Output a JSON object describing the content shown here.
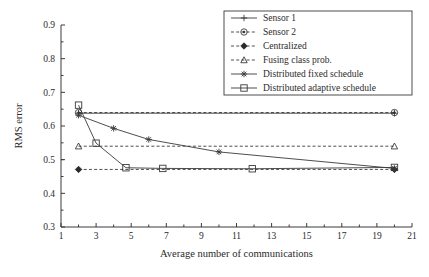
{
  "chart_data": {
    "type": "line",
    "title": "",
    "xlabel": "Average number of communications",
    "ylabel": "RMS error",
    "xlim": [
      1,
      21
    ],
    "ylim": [
      0.3,
      0.9
    ],
    "xticks": [
      1,
      3,
      5,
      7,
      9,
      11,
      13,
      15,
      17,
      19,
      21
    ],
    "yticks": [
      0.3,
      0.4,
      0.5,
      0.6,
      0.7,
      0.8,
      0.9
    ],
    "xticklabels": [
      "1",
      "3",
      "5",
      "7",
      "9",
      "11",
      "13",
      "15",
      "17",
      "19",
      "21"
    ],
    "yticklabels": [
      "0.3",
      "0.4",
      "0.5",
      "0.6",
      "0.7",
      "0.8",
      "0.9"
    ],
    "grid": false,
    "legend_position": "upper right",
    "series": [
      {
        "name": "Sensor 1",
        "marker": "plus",
        "linestyle": "solid",
        "x": [
          2,
          20
        ],
        "y": [
          0.638,
          0.638
        ]
      },
      {
        "name": "Sensor 2",
        "marker": "circle",
        "linestyle": "dashed",
        "x": [
          2,
          20
        ],
        "y": [
          0.64,
          0.64
        ]
      },
      {
        "name": "Centralized",
        "marker": "diamond-filled",
        "linestyle": "dashed",
        "x": [
          2,
          20
        ],
        "y": [
          0.471,
          0.471
        ]
      },
      {
        "name": "Fusing class prob.",
        "marker": "triangle",
        "linestyle": "dashed",
        "x": [
          2,
          20
        ],
        "y": [
          0.54,
          0.54
        ]
      },
      {
        "name": "Distributed fixed schedule",
        "marker": "star",
        "linestyle": "solid",
        "x": [
          2,
          4,
          6,
          10,
          20
        ],
        "y": [
          0.632,
          0.593,
          0.56,
          0.523,
          0.474
        ]
      },
      {
        "name": "Distributed adaptive schedule",
        "marker": "square",
        "linestyle": "solid",
        "x": [
          2,
          3,
          4.7,
          6.8,
          11.9,
          20
        ],
        "y": [
          0.662,
          0.549,
          0.476,
          0.474,
          0.473,
          0.477
        ]
      }
    ]
  },
  "legend": {
    "entries": [
      {
        "label": "Sensor 1"
      },
      {
        "label": "Sensor 2"
      },
      {
        "label": "Centralized"
      },
      {
        "label": "Fusing class prob."
      },
      {
        "label": "Distributed fixed schedule"
      },
      {
        "label": "Distributed adaptive schedule"
      }
    ]
  },
  "colors": {
    "line": "#3a3a3a",
    "text": "#2b2b2b",
    "background": "#ffffff"
  }
}
